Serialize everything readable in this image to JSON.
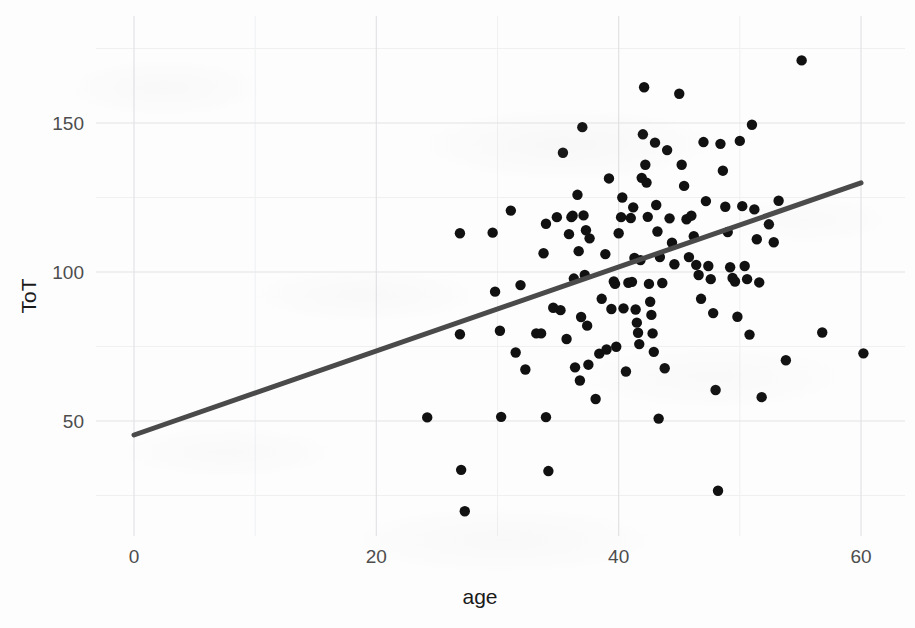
{
  "chart_data": {
    "type": "scatter",
    "title": "",
    "xlabel": "age",
    "ylabel": "ToT",
    "xlim": [
      -2,
      62
    ],
    "ylim": [
      10,
      180
    ],
    "xticks": [
      0,
      20,
      40,
      60
    ],
    "xtick_labels": [
      "0",
      "20",
      "40",
      "60"
    ],
    "yticks": [
      50,
      100,
      150
    ],
    "ytick_labels": [
      "50",
      "100",
      "150"
    ],
    "x_minor_ticks": [
      10,
      30,
      50
    ],
    "y_minor_ticks": [
      25,
      75,
      125,
      175
    ],
    "grid": true,
    "legend": null,
    "legend_position": "none",
    "point_color": "#111111",
    "point_radius": 5.2,
    "grid_major_color": "#e3e3e6",
    "grid_minor_color": "#eef0f1",
    "panel_background": "#fdfdfd",
    "trend": {
      "type": "linear-fit",
      "color": "#4a4a4a",
      "width": 5,
      "x_start": 0,
      "y_start": 45.3,
      "x_end": 60,
      "y_end": 129.9,
      "slope": 1.41,
      "intercept": 45.3
    },
    "n_points": 130,
    "points": [
      [
        24.2,
        51.2
      ],
      [
        26.9,
        113.0
      ],
      [
        26.9,
        79.1
      ],
      [
        27.0,
        33.6
      ],
      [
        27.3,
        19.7
      ],
      [
        29.6,
        113.2
      ],
      [
        29.8,
        93.4
      ],
      [
        30.2,
        80.3
      ],
      [
        30.3,
        51.4
      ],
      [
        31.5,
        73.0
      ],
      [
        31.9,
        95.6
      ],
      [
        32.3,
        67.3
      ],
      [
        33.2,
        79.4
      ],
      [
        33.6,
        79.4
      ],
      [
        33.8,
        106.3
      ],
      [
        34.0,
        51.3
      ],
      [
        34.0,
        116.2
      ],
      [
        34.2,
        33.2
      ],
      [
        34.9,
        118.4
      ],
      [
        35.2,
        87.2
      ],
      [
        35.4,
        140.0
      ],
      [
        35.7,
        77.5
      ],
      [
        35.9,
        112.7
      ],
      [
        36.1,
        118.4
      ],
      [
        36.2,
        118.9
      ],
      [
        36.3,
        97.8
      ],
      [
        36.4,
        68.0
      ],
      [
        36.6,
        125.9
      ],
      [
        36.7,
        107.0
      ],
      [
        36.8,
        63.6
      ],
      [
        36.9,
        84.9
      ],
      [
        37.0,
        148.6
      ],
      [
        37.1,
        119.0
      ],
      [
        37.2,
        99.0
      ],
      [
        37.4,
        82.0
      ],
      [
        37.5,
        68.9
      ],
      [
        37.6,
        111.3
      ],
      [
        38.1,
        57.4
      ],
      [
        38.4,
        72.6
      ],
      [
        38.6,
        91.0
      ],
      [
        39.0,
        74.0
      ],
      [
        39.2,
        131.4
      ],
      [
        39.4,
        87.6
      ],
      [
        39.6,
        96.8
      ],
      [
        39.7,
        96.0
      ],
      [
        39.8,
        74.9
      ],
      [
        40.0,
        113.0
      ],
      [
        40.2,
        118.4
      ],
      [
        40.3,
        125.0
      ],
      [
        40.4,
        87.8
      ],
      [
        40.6,
        66.6
      ],
      [
        40.8,
        96.4
      ],
      [
        41.0,
        118.1
      ],
      [
        41.1,
        96.7
      ],
      [
        41.2,
        121.7
      ],
      [
        41.3,
        104.7
      ],
      [
        41.4,
        87.4
      ],
      [
        41.5,
        83.0
      ],
      [
        41.6,
        79.6
      ],
      [
        41.7,
        75.8
      ],
      [
        41.8,
        104.0
      ],
      [
        41.9,
        131.6
      ],
      [
        42.0,
        146.2
      ],
      [
        42.1,
        162.0
      ],
      [
        42.2,
        136.0
      ],
      [
        42.3,
        130.0
      ],
      [
        42.4,
        118.5
      ],
      [
        42.5,
        96.0
      ],
      [
        42.6,
        90.0
      ],
      [
        42.7,
        85.6
      ],
      [
        42.8,
        79.4
      ],
      [
        42.9,
        73.2
      ],
      [
        43.0,
        143.4
      ],
      [
        43.1,
        122.5
      ],
      [
        43.2,
        113.6
      ],
      [
        43.4,
        105.0
      ],
      [
        43.6,
        96.3
      ],
      [
        43.8,
        67.7
      ],
      [
        44.0,
        140.9
      ],
      [
        44.2,
        118.0
      ],
      [
        44.4,
        109.8
      ],
      [
        44.6,
        102.6
      ],
      [
        45.0,
        159.8
      ],
      [
        45.2,
        136.0
      ],
      [
        45.4,
        128.9
      ],
      [
        45.6,
        117.7
      ],
      [
        45.8,
        105.0
      ],
      [
        46.0,
        118.9
      ],
      [
        46.2,
        112.0
      ],
      [
        46.4,
        102.4
      ],
      [
        46.6,
        99.0
      ],
      [
        46.8,
        91.0
      ],
      [
        47.0,
        143.6
      ],
      [
        47.2,
        123.8
      ],
      [
        47.4,
        102.0
      ],
      [
        47.6,
        97.6
      ],
      [
        47.8,
        86.2
      ],
      [
        48.0,
        60.4
      ],
      [
        48.2,
        26.6
      ],
      [
        48.4,
        143.0
      ],
      [
        48.6,
        134.0
      ],
      [
        48.8,
        121.9
      ],
      [
        49.0,
        113.4
      ],
      [
        49.2,
        101.6
      ],
      [
        49.4,
        98.0
      ],
      [
        49.6,
        96.8
      ],
      [
        49.8,
        85.0
      ],
      [
        50.0,
        144.0
      ],
      [
        50.2,
        122.1
      ],
      [
        50.4,
        102.0
      ],
      [
        50.6,
        97.6
      ],
      [
        50.8,
        79.0
      ],
      [
        51.0,
        149.4
      ],
      [
        51.2,
        121.0
      ],
      [
        51.4,
        111.0
      ],
      [
        51.6,
        96.5
      ],
      [
        51.8,
        58.0
      ],
      [
        52.4,
        116.0
      ],
      [
        52.8,
        110.0
      ],
      [
        53.2,
        123.9
      ],
      [
        53.8,
        70.4
      ],
      [
        55.1,
        171.0
      ],
      [
        56.8,
        79.7
      ],
      [
        60.2,
        72.7
      ],
      [
        43.3,
        50.8
      ],
      [
        38.9,
        106.0
      ],
      [
        37.3,
        114.0
      ],
      [
        34.6,
        88.0
      ],
      [
        31.1,
        120.6
      ]
    ]
  }
}
